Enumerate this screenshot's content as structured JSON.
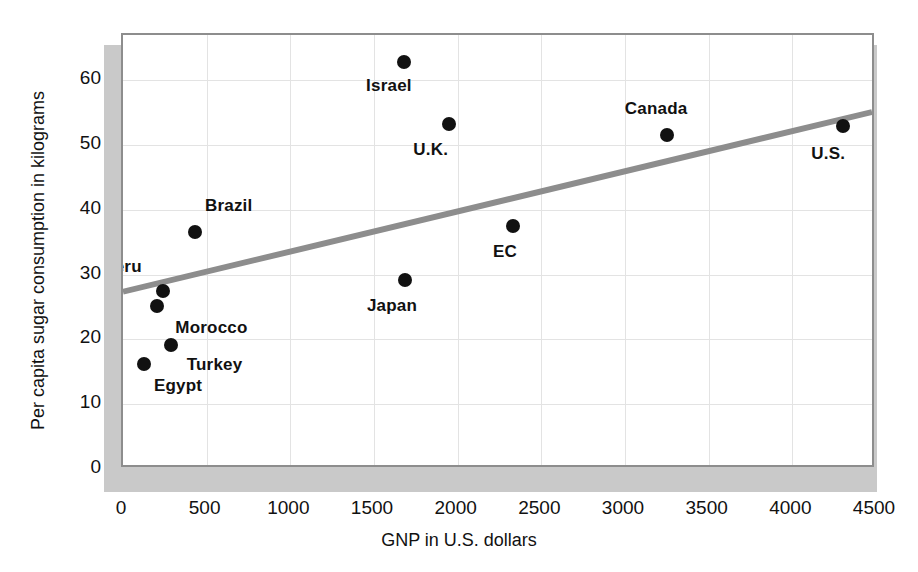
{
  "chart_data": {
    "type": "scatter",
    "title": "",
    "xlabel": "GNP in U.S. dollars",
    "ylabel": "Per capita sugar consumption in kilograms",
    "xlim": [
      0,
      4500
    ],
    "ylim": [
      0,
      67
    ],
    "xticks": [
      0,
      500,
      1000,
      1500,
      2000,
      2500,
      3000,
      3500,
      4000,
      4500
    ],
    "xtick_labels": [
      "0",
      "500",
      "1000",
      "1500",
      "2000",
      "2500",
      "3000",
      "3500",
      "4000",
      "4500"
    ],
    "yticks": [
      0,
      10,
      20,
      30,
      40,
      50,
      60
    ],
    "ytick_labels": [
      "0",
      "10",
      "20",
      "30",
      "40",
      "50",
      "60"
    ],
    "grid": true,
    "legend": "none",
    "marker_color": "#111111",
    "trendline_color": "#8d8d8d",
    "points": [
      {
        "label": "Egypt",
        "x": 125,
        "y": 16.2,
        "label_dx": 10,
        "label_dy": 22
      },
      {
        "label": "Morocco",
        "x": 205,
        "y": 25.2,
        "label_dx": 18,
        "label_dy": 22
      },
      {
        "label": "Peru",
        "x": 240,
        "y": 27.5,
        "label_dx": -60,
        "label_dy": -24
      },
      {
        "label": "Turkey",
        "x": 285,
        "y": 19.2,
        "label_dx": 16,
        "label_dy": 20
      },
      {
        "label": "Brazil",
        "x": 430,
        "y": 36.6,
        "label_dx": 10,
        "label_dy": -26
      },
      {
        "label": "Israel",
        "x": 1680,
        "y": 62.8,
        "label_dx": -38,
        "label_dy": 24
      },
      {
        "label": "Japan",
        "x": 1685,
        "y": 29.2,
        "label_dx": -38,
        "label_dy": 26
      },
      {
        "label": "U.K.",
        "x": 1950,
        "y": 53.2,
        "label_dx": -36,
        "label_dy": 26
      },
      {
        "label": "EC",
        "x": 2330,
        "y": 37.5,
        "label_dx": -20,
        "label_dy": 26
      },
      {
        "label": "Canada",
        "x": 3250,
        "y": 51.5,
        "label_dx": -42,
        "label_dy": -26
      },
      {
        "label": "U.S.",
        "x": 4305,
        "y": 52.9,
        "label_dx": -32,
        "label_dy": 28
      }
    ],
    "trendline": {
      "x_start": 0,
      "y_start": 27.0,
      "x_end": 4500,
      "y_end": 55.0
    }
  }
}
